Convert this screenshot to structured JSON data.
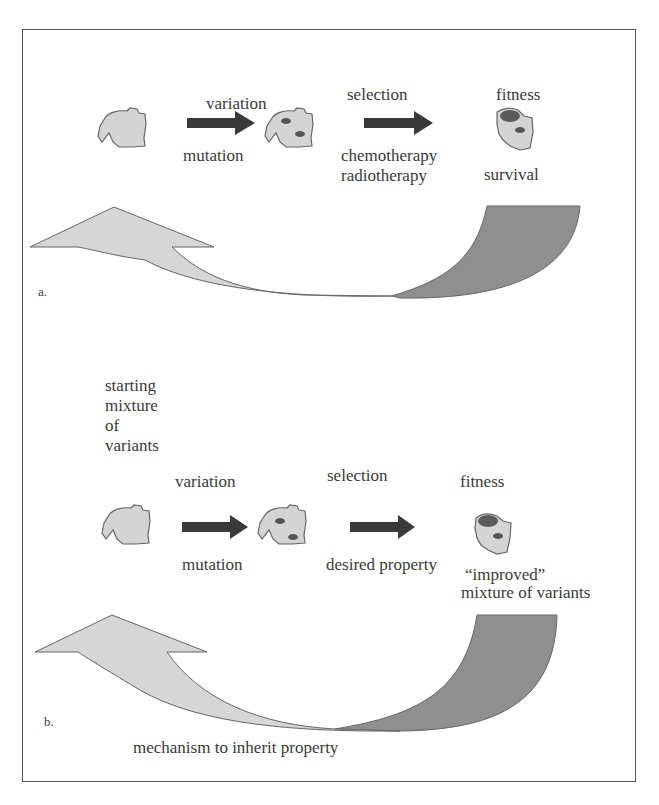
{
  "panel_a": {
    "label": "a.",
    "steps": [
      {
        "top": "variation",
        "bottom": "mutation"
      },
      {
        "top": "selection",
        "bottom_lines": [
          "chemotherapy",
          "radiotherapy"
        ]
      },
      {
        "top": "fitness",
        "bottom": "survival"
      }
    ]
  },
  "panel_b": {
    "label": "b.",
    "start_lines": [
      "starting",
      "mixture",
      "of",
      "variants"
    ],
    "steps": [
      {
        "top": "variation",
        "bottom": "mutation"
      },
      {
        "top": "selection",
        "bottom": "desired property"
      },
      {
        "top": "fitness",
        "bottom_lines": [
          "“improved”",
          "mixture of variants"
        ]
      }
    ],
    "loop_caption": "mechanism to inherit property"
  },
  "colors": {
    "cell_fill": "#d4d4d4",
    "outline": "#666666",
    "dark_spot": "#5a5a5a",
    "arrow_dark": "#3a3a3a",
    "return_arrow_light": "#d6d6d6",
    "return_arrow_dark": "#8f8f8f"
  }
}
